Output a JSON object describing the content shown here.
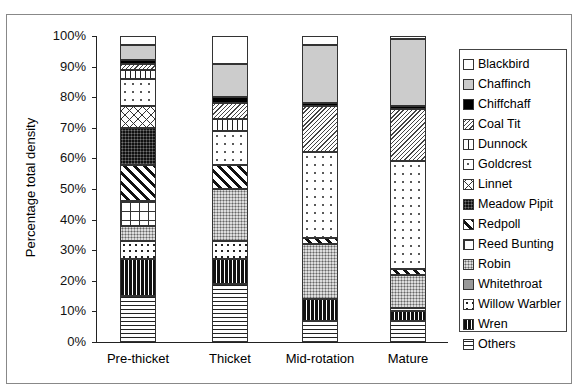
{
  "chart_data": {
    "type": "bar",
    "stacked": true,
    "title": "",
    "xlabel": "",
    "ylabel": "Percentage total density",
    "ylim": [
      0,
      100
    ],
    "yticks": [
      "0%",
      "10%",
      "20%",
      "30%",
      "40%",
      "50%",
      "60%",
      "70%",
      "80%",
      "90%",
      "100%"
    ],
    "categories": [
      "Pre-thicket",
      "Thicket",
      "Mid-rotation",
      "Mature"
    ],
    "series": [
      {
        "name": "Others",
        "values": [
          15,
          19,
          7,
          7
        ]
      },
      {
        "name": "Wren",
        "values": [
          12,
          8,
          7,
          3
        ]
      },
      {
        "name": "Willow Warbler",
        "values": [
          6,
          6,
          0,
          1
        ]
      },
      {
        "name": "Whitethroat",
        "values": [
          0,
          0,
          0,
          0
        ]
      },
      {
        "name": "Robin",
        "values": [
          5,
          17,
          18,
          11
        ]
      },
      {
        "name": "Reed Bunting",
        "values": [
          8,
          0,
          0,
          0
        ]
      },
      {
        "name": "Redpoll",
        "values": [
          12,
          8,
          2,
          2
        ]
      },
      {
        "name": "Meadow Pipit",
        "values": [
          12,
          0,
          0,
          0
        ]
      },
      {
        "name": "Linnet",
        "values": [
          7,
          0,
          0,
          0
        ]
      },
      {
        "name": "Goldcrest",
        "values": [
          9,
          11,
          28,
          35
        ]
      },
      {
        "name": "Dunnock",
        "values": [
          3,
          4,
          0,
          0
        ]
      },
      {
        "name": "Coal Tit",
        "values": [
          2,
          5,
          15,
          17
        ]
      },
      {
        "name": "Chiffchaff",
        "values": [
          1,
          2,
          1,
          1
        ]
      },
      {
        "name": "Chaffinch",
        "values": [
          5,
          11,
          19,
          22
        ]
      },
      {
        "name": "Blackbird",
        "values": [
          3,
          9,
          3,
          1
        ]
      }
    ],
    "legend_position": "right",
    "grid": false
  },
  "legend": [
    "Blackbird",
    "Chaffinch",
    "Chiffchaff",
    "Coal Tit",
    "Dunnock",
    "Goldcrest",
    "Linnet",
    "Meadow Pipit",
    "Redpoll",
    "Reed Bunting",
    "Robin",
    "Whitethroat",
    "Willow Warbler",
    "Wren",
    "Others"
  ]
}
